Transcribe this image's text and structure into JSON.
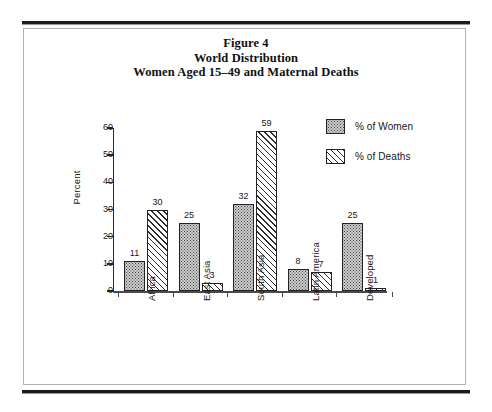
{
  "figure": {
    "title_lines": [
      "Figure 4",
      "World Distribution",
      "Women Aged 15–49 and Maternal Deaths"
    ]
  },
  "legend": {
    "items": [
      {
        "label": "% of Women",
        "pattern": "stipple-fill"
      },
      {
        "label": "% of Deaths",
        "pattern": "diagonal-hatch"
      }
    ]
  },
  "axes": {
    "y_title": "Percent",
    "y_ticks": [
      "0",
      "10",
      "20",
      "30",
      "40",
      "50",
      "60"
    ]
  },
  "chart_data": {
    "type": "bar",
    "xlabel": "",
    "ylabel": "Percent",
    "ylim": [
      0,
      60
    ],
    "ytick_step": 10,
    "grid": false,
    "legend_position": "top-right",
    "categories": [
      "Africa",
      "East Asia",
      "South Asia",
      "Latin America",
      "Developed"
    ],
    "series": [
      {
        "name": "% of Women",
        "values": [
          11,
          25,
          32,
          8,
          25
        ]
      },
      {
        "name": "% of Deaths",
        "values": [
          30,
          3,
          59,
          7,
          1
        ]
      }
    ]
  }
}
